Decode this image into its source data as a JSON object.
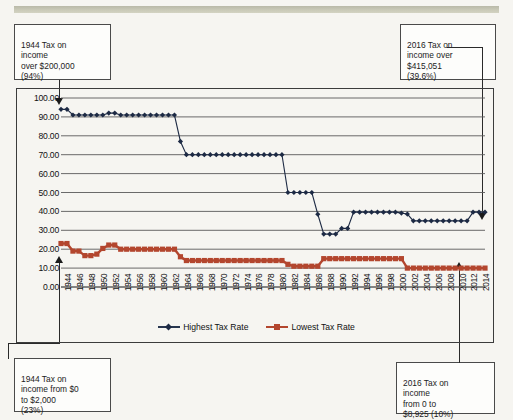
{
  "callouts": {
    "top_left": {
      "text": "1944 Tax on\nincome\nover $200,000\n(94%)"
    },
    "top_right": {
      "text": "2016 Tax on\nincome over\n$415,051\n(39.6%)"
    },
    "bottom_left": {
      "text": "1944 Tax on\nincome from $0\nto $2,000\n(23%)"
    },
    "bottom_right": {
      "text": "2016 Tax on\nincome\nfrom 0 to\n$8,925 (10%)"
    }
  },
  "legend": {
    "highest_label": "Highest Tax Rate",
    "lowest_label": "Lowest Tax Rate"
  },
  "colors": {
    "highest": "#1d2a44",
    "lowest": "#b3462e",
    "grid": "#5a5a5a",
    "frame": "#3c3c3c",
    "background": "#f6f5f1"
  },
  "chart_data": {
    "type": "line",
    "title": "",
    "xlabel": "",
    "ylabel": "",
    "ylim": [
      0,
      100
    ],
    "ytick_labels": [
      "0.00",
      "10.00",
      "20.00",
      "30.00",
      "40.00",
      "50.00",
      "60.00",
      "70.00",
      "80.00",
      "90.00",
      "100.00"
    ],
    "yticks": [
      0,
      10,
      20,
      30,
      40,
      50,
      60,
      70,
      80,
      90,
      100
    ],
    "grid": true,
    "legend_position": "bottom",
    "xtick_labels": [
      "1944",
      "1946",
      "1948",
      "1950",
      "1952",
      "1954",
      "1956",
      "1958",
      "1960",
      "1962",
      "1964",
      "1966",
      "1968",
      "1970",
      "1972",
      "1974",
      "1976",
      "1978",
      "1980",
      "1982",
      "1984",
      "1986",
      "1988",
      "1990",
      "1992",
      "1994",
      "1996",
      "1998",
      "2000",
      "2002",
      "2004",
      "2006",
      "2008",
      "2010",
      "2012",
      "2014"
    ],
    "x": [
      1944,
      1945,
      1946,
      1947,
      1948,
      1949,
      1950,
      1951,
      1952,
      1953,
      1954,
      1955,
      1956,
      1957,
      1958,
      1959,
      1960,
      1961,
      1962,
      1963,
      1964,
      1965,
      1966,
      1967,
      1968,
      1969,
      1970,
      1971,
      1972,
      1973,
      1974,
      1975,
      1976,
      1977,
      1978,
      1979,
      1980,
      1981,
      1982,
      1983,
      1984,
      1985,
      1986,
      1987,
      1988,
      1989,
      1990,
      1991,
      1992,
      1993,
      1994,
      1995,
      1996,
      1997,
      1998,
      1999,
      2000,
      2001,
      2002,
      2003,
      2004,
      2005,
      2006,
      2007,
      2008,
      2009,
      2010,
      2011,
      2012,
      2013,
      2014,
      2015
    ],
    "series": [
      {
        "name": "Highest Tax Rate",
        "marker": "diamond",
        "color": "#1d2a44",
        "values": [
          94,
          94,
          91,
          91,
          91,
          91,
          91,
          91,
          92,
          92,
          91,
          91,
          91,
          91,
          91,
          91,
          91,
          91,
          91,
          91,
          77,
          70,
          70,
          70,
          70,
          70,
          70,
          70,
          70,
          70,
          70,
          70,
          70,
          70,
          70,
          70,
          70,
          70,
          50,
          50,
          50,
          50,
          50,
          38.5,
          28,
          28,
          28,
          31,
          31,
          39.6,
          39.6,
          39.6,
          39.6,
          39.6,
          39.6,
          39.6,
          39.6,
          39.1,
          38.6,
          35,
          35,
          35,
          35,
          35,
          35,
          35,
          35,
          35,
          35,
          39.6,
          39.6,
          39.6
        ]
      },
      {
        "name": "Lowest Tax Rate",
        "marker": "square",
        "color": "#b3462e",
        "values": [
          23,
          23,
          19,
          19,
          16.6,
          16.6,
          17.4,
          20.4,
          22.2,
          22.2,
          20,
          20,
          20,
          20,
          20,
          20,
          20,
          20,
          20,
          20,
          16,
          14,
          14,
          14,
          14,
          14,
          14,
          14,
          14,
          14,
          14,
          14,
          14,
          14,
          14,
          14,
          14,
          14,
          12,
          11,
          11,
          11,
          11,
          11,
          15,
          15,
          15,
          15,
          15,
          15,
          15,
          15,
          15,
          15,
          15,
          15,
          15,
          15,
          10,
          10,
          10,
          10,
          10,
          10,
          10,
          10,
          10,
          10,
          10,
          10,
          10,
          10
        ]
      }
    ]
  }
}
